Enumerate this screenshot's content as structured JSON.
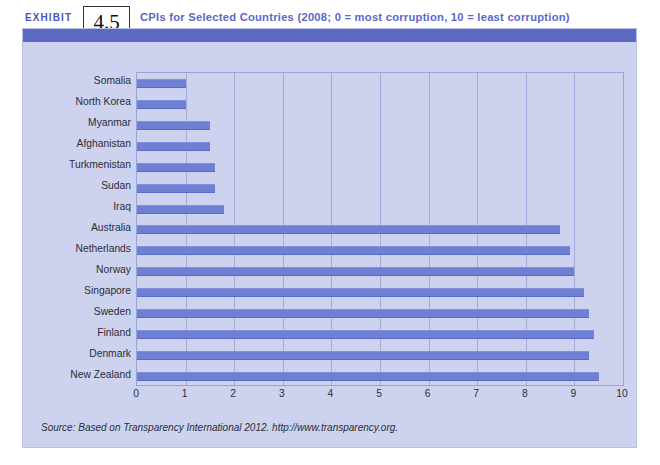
{
  "exhibit": {
    "word": "EXHIBIT",
    "number": "4.5",
    "title": "CPIs for Selected Countries (2008; 0 = most corruption, 10 = least corruption)"
  },
  "source": {
    "text": "Source: Based on Transparency International 2012. http://www.transparency.org."
  },
  "colors": {
    "bar": "#6f7fd4",
    "panel_background": "#cdd3ee",
    "header_band": "#5c6ac4",
    "title_text": "#5a68c8",
    "gridline": "#9aa3d8"
  },
  "chart_data": {
    "type": "bar",
    "orientation": "horizontal",
    "title": "CPIs for Selected Countries (2008; 0 = most corruption, 10 = least corruption)",
    "xlabel": "",
    "ylabel": "",
    "xlim": [
      0,
      10
    ],
    "xticks": [
      0,
      1,
      2,
      3,
      4,
      5,
      6,
      7,
      8,
      9,
      10
    ],
    "xtick_labels": [
      "0",
      "1",
      "2",
      "3",
      "4",
      "5",
      "6",
      "7",
      "8",
      "9",
      "10"
    ],
    "grid": true,
    "legend": false,
    "categories": [
      "Somalia",
      "North Korea",
      "Myanmar",
      "Afghanistan",
      "Turkmenistan",
      "Sudan",
      "Iraq",
      "Australia",
      "Netherlands",
      "Norway",
      "Singapore",
      "Sweden",
      "Finland",
      "Denmark",
      "New Zealand"
    ],
    "values": [
      1.0,
      1.0,
      1.5,
      1.5,
      1.6,
      1.6,
      1.8,
      8.7,
      8.9,
      9.0,
      9.2,
      9.3,
      9.4,
      9.3,
      9.5
    ],
    "series": [
      {
        "name": "Corruption Perceptions Index 2008",
        "values": [
          1.0,
          1.0,
          1.5,
          1.5,
          1.6,
          1.6,
          1.8,
          8.7,
          8.9,
          9.0,
          9.2,
          9.3,
          9.4,
          9.3,
          9.5
        ]
      }
    ]
  }
}
